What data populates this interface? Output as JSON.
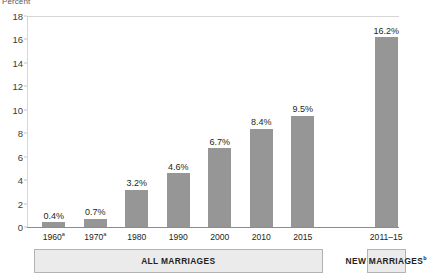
{
  "chart_data": {
    "type": "bar",
    "title": "",
    "subtitle": "",
    "xlabel": "",
    "ylabel": "Percent",
    "ylim": [
      0,
      18
    ],
    "ytick_step": 2,
    "yticks": [
      "0",
      "2",
      "4",
      "6",
      "8",
      "10",
      "12",
      "14",
      "16",
      "18"
    ],
    "grid": false,
    "legend": "none",
    "categories": [
      "1960",
      "1970",
      "1980",
      "1990",
      "2000",
      "2010",
      "2015",
      "2011–15"
    ],
    "category_superscripts": [
      "a",
      "a",
      "",
      "",
      "",
      "",
      "",
      ""
    ],
    "values": [
      0.4,
      0.7,
      3.2,
      4.6,
      6.7,
      8.4,
      9.5,
      16.2
    ],
    "data_labels": [
      "0.4%",
      "0.7%",
      "3.2%",
      "4.6%",
      "6.7%",
      "8.4%",
      "9.5%",
      "16.2%"
    ],
    "groups": [
      {
        "label": "ALL MARRIAGES",
        "superscript": "",
        "from": 0,
        "to": 6
      },
      {
        "label": "NEW MARRIAGES",
        "superscript": "b",
        "from": 7,
        "to": 7
      }
    ],
    "colors": {
      "bar": "#969696",
      "axis": "#8c8c8c",
      "group_box_fill": "#ebebeb",
      "group_box_border": "#b3b3b3",
      "text": "#231f20",
      "axis_title": "#58595b"
    }
  }
}
